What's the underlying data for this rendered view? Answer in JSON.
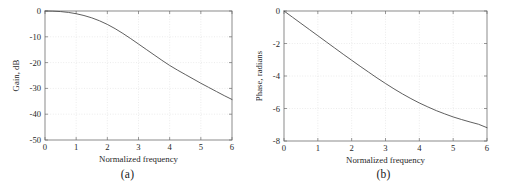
{
  "figure": {
    "background": "#ffffff",
    "line_color": "#4d4d4d",
    "axis_color": "#6e6e6e",
    "grid_color": "#d9d9d9",
    "panels": [
      {
        "caption": "(a)"
      },
      {
        "caption": "(b)"
      }
    ]
  },
  "chart_data": [
    {
      "type": "line",
      "panel": "(a)",
      "title": "",
      "xlabel": "Normalized frequency",
      "ylabel": "Gain, dB",
      "xlim": [
        0,
        6
      ],
      "ylim": [
        -50,
        0
      ],
      "xticks": [
        0,
        1,
        2,
        3,
        4,
        5,
        6
      ],
      "xticklabels": [
        "0",
        "1",
        "2",
        "3",
        "4",
        "5",
        "6"
      ],
      "yticks": [
        -50,
        -40,
        -30,
        -20,
        -10,
        0
      ],
      "yticklabels": [
        "-50",
        "-40",
        "-30",
        "-20",
        "-10",
        "0"
      ],
      "grid": true,
      "legend": null,
      "series": [
        {
          "name": "Gain",
          "x": [
            0,
            0.25,
            0.5,
            0.75,
            1,
            1.25,
            1.5,
            1.75,
            2,
            2.25,
            2.5,
            2.75,
            3,
            3.25,
            3.5,
            3.75,
            4,
            4.25,
            4.5,
            4.75,
            5,
            5.25,
            5.5,
            5.75,
            6
          ],
          "values": [
            0,
            -0.06,
            -0.22,
            -0.55,
            -1.05,
            -1.75,
            -2.65,
            -3.8,
            -5.2,
            -6.85,
            -8.7,
            -10.7,
            -12.8,
            -14.9,
            -17.0,
            -19.1,
            -21.1,
            -22.9,
            -24.6,
            -26.3,
            -28.0,
            -29.6,
            -31.2,
            -32.8,
            -34.3
          ]
        }
      ]
    },
    {
      "type": "line",
      "panel": "(b)",
      "title": "",
      "xlabel": "Normalized frequency",
      "ylabel": "Phase, radians",
      "xlim": [
        0,
        6
      ],
      "ylim": [
        -8,
        0
      ],
      "xticks": [
        0,
        1,
        2,
        3,
        4,
        5,
        6
      ],
      "xticklabels": [
        "0",
        "1",
        "2",
        "3",
        "4",
        "5",
        "6"
      ],
      "yticks": [
        -8,
        -6,
        -4,
        -2,
        0
      ],
      "yticklabels": [
        "-8",
        "-6",
        "-4",
        "-2",
        "0"
      ],
      "grid": true,
      "legend": null,
      "series": [
        {
          "name": "Phase",
          "x": [
            0,
            0.25,
            0.5,
            0.75,
            1,
            1.25,
            1.5,
            1.75,
            2,
            2.25,
            2.5,
            2.75,
            3,
            3.25,
            3.5,
            3.75,
            4,
            4.25,
            4.5,
            4.75,
            5,
            5.25,
            5.5,
            5.75,
            6
          ],
          "values": [
            0,
            -0.38,
            -0.76,
            -1.14,
            -1.52,
            -1.9,
            -2.28,
            -2.66,
            -3.03,
            -3.4,
            -3.76,
            -4.12,
            -4.46,
            -4.79,
            -5.1,
            -5.39,
            -5.66,
            -5.9,
            -6.13,
            -6.33,
            -6.52,
            -6.68,
            -6.83,
            -6.97,
            -7.18
          ]
        }
      ]
    }
  ]
}
